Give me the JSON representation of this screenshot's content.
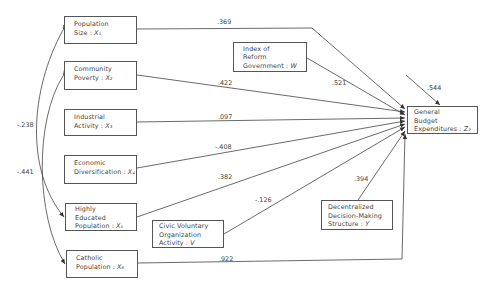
{
  "diagram": {
    "type": "path-diagram",
    "nodes": {
      "x1": {
        "lines": [
          "Population",
          "Size : "
        ],
        "var": "X₁"
      },
      "x2": {
        "lines": [
          "Community",
          "Poverty : "
        ],
        "var": "X₂"
      },
      "x3": {
        "lines": [
          "Industrial",
          "Activity : "
        ],
        "var": "X₃"
      },
      "x4": {
        "lines": [
          "Economic",
          "Diversification : "
        ],
        "var": "X₄"
      },
      "x5": {
        "lines": [
          "Highly",
          "Educated",
          "Population : "
        ],
        "var": "X₅"
      },
      "x6": {
        "lines": [
          "Catholic",
          "Population : "
        ],
        "var": "X₆"
      },
      "w": {
        "lines": [
          "Index of",
          "Reform",
          "Government : "
        ],
        "var": "W"
      },
      "v": {
        "lines": [
          "Civic Voluntary",
          "Organization",
          "Activity : "
        ],
        "var": "V"
      },
      "y": {
        "lines": [
          "Decentralized",
          "Decision-Making",
          "Structure : "
        ],
        "var": "Y"
      },
      "z": {
        "lines": [
          "General",
          "Budget",
          "Expenditures : "
        ],
        "var": "Z₂"
      }
    },
    "paths": [
      {
        "from": "x1",
        "to": "z",
        "coefficient": ".369"
      },
      {
        "from": "x2",
        "to": "z",
        "coefficient": ".422"
      },
      {
        "from": "x3",
        "to": "z",
        "coefficient": ".097"
      },
      {
        "from": "x4",
        "to": "z",
        "coefficient": "-.408"
      },
      {
        "from": "x5",
        "to": "z",
        "coefficient": ".382"
      },
      {
        "from": "v",
        "to": "z",
        "coefficient": "-.126"
      },
      {
        "from": "x6",
        "to": "z",
        "coefficient": ".922"
      },
      {
        "from": "w",
        "to": "z",
        "coefficient": ".521"
      },
      {
        "from": "y",
        "to": "z",
        "coefficient": ".394"
      },
      {
        "from": "residual",
        "to": "z",
        "coefficient": ".544"
      }
    ],
    "correlations": [
      {
        "between": [
          "x1",
          "x5"
        ],
        "coefficient": "-.238"
      },
      {
        "between": [
          "x2",
          "x6"
        ],
        "coefficient": "-.441"
      }
    ]
  }
}
